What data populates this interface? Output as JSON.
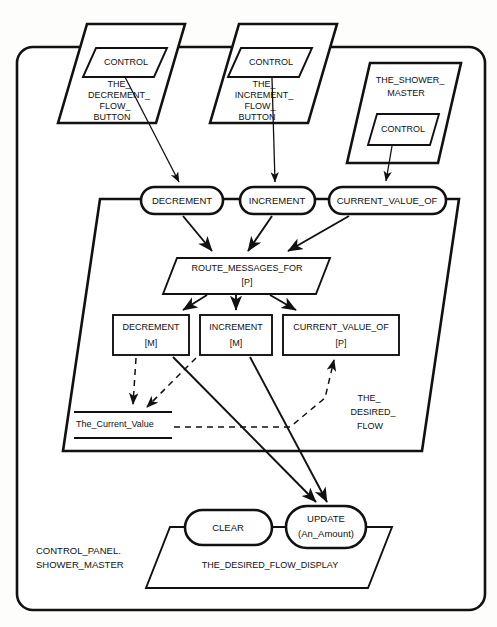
{
  "diagram": {
    "type": "object-interaction-diagram",
    "colors": {
      "stroke": "#111111",
      "fill": "#ffffff",
      "background": "#fdfdfc"
    }
  },
  "outer_system": {
    "label_line1": "CONTROL_PANEL.",
    "label_line2": "SHOWER_MASTER"
  },
  "top_objects": [
    {
      "id": "decrement-flow-button",
      "name_line1": "THE_",
      "name_line2": "DECREMENT_",
      "name_line3": "FLOW_",
      "name_line4": "BUTTON",
      "inner_operation": "CONTROL"
    },
    {
      "id": "increment-flow-button",
      "name_line1": "THE_",
      "name_line2": "INCREMENT_",
      "name_line3": "FLOW_",
      "name_line4": "BUTTON",
      "inner_operation": "CONTROL"
    },
    {
      "id": "shower-master",
      "name_line1": "THE_SHOWER_",
      "name_line2": "MASTER",
      "inner_operation": "CONTROL"
    }
  ],
  "desired_flow": {
    "name_line1": "THE_",
    "name_line2": "DESIRED_",
    "name_line3": "FLOW",
    "operations": [
      {
        "id": "op-decrement",
        "label": "DECREMENT"
      },
      {
        "id": "op-increment",
        "label": "INCREMENT"
      },
      {
        "id": "op-current-value-of",
        "label": "CURRENT_VALUE_OF"
      }
    ],
    "router": {
      "label_line1": "ROUTE_MESSAGES_FOR",
      "label_line2": "[P]"
    },
    "methods": [
      {
        "id": "method-decrement",
        "label_line1": "DECREMENT",
        "label_line2": "[M]"
      },
      {
        "id": "method-increment",
        "label_line1": "INCREMENT",
        "label_line2": "[M]"
      },
      {
        "id": "method-current-value-of",
        "label_line1": "CURRENT_VALUE_OF",
        "label_line2": "[P]"
      }
    ],
    "attribute": {
      "id": "attr-the-current-value",
      "label": "The_Current_Value"
    }
  },
  "desired_flow_display": {
    "name": "THE_DESIRED_FLOW_DISPLAY",
    "operations": [
      {
        "id": "op-clear",
        "label_line1": "CLEAR",
        "label_line2": ""
      },
      {
        "id": "op-update",
        "label_line1": "UPDATE",
        "label_line2": "(An_Amount)"
      }
    ]
  }
}
